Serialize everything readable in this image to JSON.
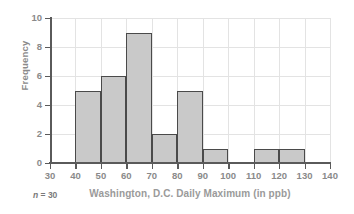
{
  "chart_data": {
    "type": "bar",
    "title": "",
    "subtitle": "",
    "xlabel": "Washington, D.C. Daily Maximum (in ppb)",
    "ylabel": "Frequency",
    "annotation": "n = 30",
    "annotation_symbol": "n",
    "annotation_rest": " = 30",
    "bin_width": 10,
    "xlim": [
      30,
      140
    ],
    "ylim": [
      0,
      10
    ],
    "xticks": [
      30,
      40,
      50,
      60,
      70,
      80,
      90,
      100,
      110,
      120,
      130,
      140
    ],
    "yticks": [
      0,
      2,
      4,
      6,
      8,
      10
    ],
    "grid": true,
    "legend": "none",
    "bin_edges": [
      30,
      40,
      50,
      60,
      70,
      80,
      90,
      100,
      110,
      120,
      130,
      140
    ],
    "categories": [
      "30-40",
      "40-50",
      "50-60",
      "60-70",
      "70-80",
      "80-90",
      "90-100",
      "100-110",
      "110-120",
      "120-130",
      "130-140"
    ],
    "values": [
      0,
      5,
      6,
      9,
      2,
      5,
      1,
      0,
      1,
      1,
      0
    ],
    "bars": [
      {
        "x0": 30,
        "x1": 40,
        "value": 0
      },
      {
        "x0": 40,
        "x1": 50,
        "value": 5
      },
      {
        "x0": 50,
        "x1": 60,
        "value": 6
      },
      {
        "x0": 60,
        "x1": 70,
        "value": 9
      },
      {
        "x0": 70,
        "x1": 80,
        "value": 2
      },
      {
        "x0": 80,
        "x1": 90,
        "value": 5
      },
      {
        "x0": 90,
        "x1": 100,
        "value": 1
      },
      {
        "x0": 100,
        "x1": 110,
        "value": 0
      },
      {
        "x0": 110,
        "x1": 120,
        "value": 1
      },
      {
        "x0": 120,
        "x1": 130,
        "value": 1
      },
      {
        "x0": 130,
        "x1": 140,
        "value": 0
      }
    ],
    "colors": {
      "bar_fill": "#c9c9c9",
      "bar_edge": "#4a4a4a",
      "axis": "#5a5a5a",
      "grid": "#e3e3e3",
      "text": "#8a8a8a",
      "background": "#ffffff"
    }
  }
}
